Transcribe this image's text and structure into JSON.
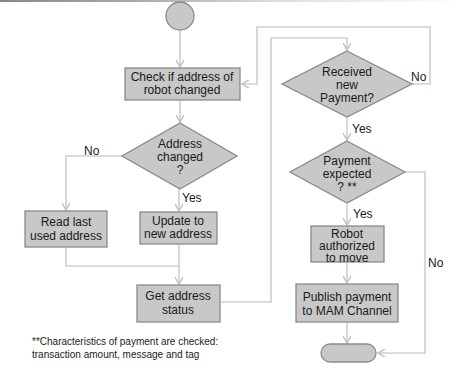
{
  "diagram": {
    "type": "flowchart",
    "colors": {
      "shape_fill": "#c8c8c8",
      "shape_stroke": "#8a8a8a",
      "connector": "#c8c8c8",
      "text": "#1a1a1a",
      "background": "#ffffff"
    },
    "nodes": {
      "start": {
        "shape": "circle",
        "label": ""
      },
      "check_address": {
        "shape": "process",
        "lines": [
          "Check if address of",
          "robot changed"
        ]
      },
      "address_changed": {
        "shape": "decision",
        "lines": [
          "Address",
          "changed",
          "?"
        ]
      },
      "read_last": {
        "shape": "process",
        "lines": [
          "Read last",
          "used address"
        ]
      },
      "update_address": {
        "shape": "process",
        "lines": [
          "Update to",
          "new address"
        ]
      },
      "get_status": {
        "shape": "process",
        "lines": [
          "Get address",
          "status"
        ]
      },
      "received_payment": {
        "shape": "decision",
        "lines": [
          "Received",
          "new",
          "Payment?"
        ]
      },
      "payment_expected": {
        "shape": "decision",
        "lines": [
          "Payment",
          "expected",
          "? **"
        ]
      },
      "robot_authorized": {
        "shape": "process",
        "lines": [
          "Robot",
          "authorized",
          "to move"
        ]
      },
      "publish_payment": {
        "shape": "process",
        "lines": [
          "Publish payment",
          "to MAM Channel"
        ]
      },
      "end": {
        "shape": "terminator",
        "label": ""
      }
    },
    "edge_labels": {
      "address_no": "No",
      "address_yes": "Yes",
      "received_no": "No",
      "received_yes": "Yes",
      "expected_yes": "Yes",
      "expected_no": "No"
    },
    "edges": [
      [
        "start",
        "check_address"
      ],
      [
        "check_address",
        "address_changed"
      ],
      [
        "address_changed",
        "read_last",
        "No"
      ],
      [
        "address_changed",
        "update_address",
        "Yes"
      ],
      [
        "read_last",
        "get_status"
      ],
      [
        "update_address",
        "get_status"
      ],
      [
        "get_status",
        "received_payment"
      ],
      [
        "received_payment",
        "check_address",
        "No"
      ],
      [
        "received_payment",
        "payment_expected",
        "Yes"
      ],
      [
        "payment_expected",
        "robot_authorized",
        "Yes"
      ],
      [
        "payment_expected",
        "end",
        "No"
      ],
      [
        "robot_authorized",
        "publish_payment"
      ],
      [
        "publish_payment",
        "end"
      ]
    ],
    "footnote": {
      "line1": "**Characteristics of payment are checked:",
      "line2": "transaction amount, message and tag"
    }
  }
}
